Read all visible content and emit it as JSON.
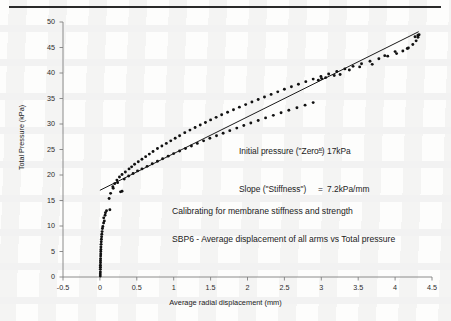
{
  "figure": {
    "axis_titles": {
      "x": "Average radial displacement (mm)",
      "y": "Total Pressure (kPa)"
    },
    "annotations": {
      "initial_pressure_label": "Initial pressure (\"Zero\")",
      "initial_pressure_eq": "=",
      "initial_pressure_value": "17kPa",
      "slope_label": "Slope (\"Stiffness\")",
      "slope_eq": "=",
      "slope_value": "7.2kPa/mm",
      "caption_1": "Calibrating for membrane stiffness and strength",
      "caption_2": "SBP6 - Average displacement of all arms vs Total pressure"
    },
    "colors": {
      "marker": "#111111",
      "fit_line": "#1a1a1a",
      "axis": "#808080",
      "rule": "#2a2a2a",
      "background": "#fdfdfc"
    }
  },
  "chart_data": {
    "type": "scatter",
    "title": "",
    "xlabel": "Average radial displacement (mm)",
    "ylabel": "Total Pressure (kPa)",
    "xlim": [
      -0.5,
      4.5
    ],
    "ylim": [
      0,
      50
    ],
    "xticks": [
      -0.5,
      0,
      0.5,
      1,
      1.5,
      2,
      2.5,
      3,
      3.5,
      4,
      4.5
    ],
    "xtick_labels": [
      "-0.5",
      "0",
      "0.5",
      "1",
      "1.5",
      "2",
      "2.5",
      "3",
      "3.5",
      "4",
      "4.5"
    ],
    "yticks": [
      0,
      5,
      10,
      15,
      20,
      25,
      30,
      35,
      40,
      45,
      50
    ],
    "ytick_labels": [
      "0",
      "5",
      "10",
      "15",
      "20",
      "25",
      "30",
      "35",
      "40",
      "45",
      "50"
    ],
    "grid": false,
    "legend": null,
    "fit_line": {
      "name": "Linear fit",
      "intercept": 17.0,
      "slope": 7.2,
      "x_start": 0.0,
      "x_end": 4.32
    },
    "series": [
      {
        "name": "Initial vertical loading",
        "marker": "filled-circle",
        "points": [
          [
            0.005,
            0.2
          ],
          [
            0.005,
            0.6
          ],
          [
            0.006,
            1.0
          ],
          [
            0.006,
            1.5
          ],
          [
            0.007,
            1.9
          ],
          [
            0.007,
            2.3
          ],
          [
            0.008,
            2.8
          ],
          [
            0.008,
            3.2
          ],
          [
            0.009,
            3.6
          ],
          [
            0.01,
            4.1
          ],
          [
            0.011,
            4.5
          ],
          [
            0.012,
            5.0
          ],
          [
            0.013,
            5.4
          ],
          [
            0.014,
            5.9
          ],
          [
            0.016,
            6.4
          ],
          [
            0.018,
            6.9
          ],
          [
            0.02,
            7.4
          ],
          [
            0.023,
            7.9
          ],
          [
            0.026,
            8.4
          ],
          [
            0.03,
            8.9
          ],
          [
            0.034,
            9.5
          ],
          [
            0.04,
            9.9
          ],
          [
            0.05,
            10.6
          ],
          [
            0.06,
            11.0
          ],
          [
            0.052,
            11.6
          ],
          [
            0.07,
            12.1
          ],
          [
            0.075,
            12.6
          ],
          [
            0.09,
            13.0
          ]
        ]
      },
      {
        "name": "Loading branch (upper)",
        "marker": "filled-circle",
        "points": [
          [
            0.125,
            15.4
          ],
          [
            0.145,
            16.4
          ],
          [
            0.175,
            17.7
          ],
          [
            0.2,
            18.3
          ],
          [
            0.23,
            19.0
          ],
          [
            0.265,
            19.6
          ],
          [
            0.3,
            20.1
          ],
          [
            0.345,
            20.6
          ],
          [
            0.395,
            21.2
          ],
          [
            0.43,
            21.6
          ],
          [
            0.47,
            22.1
          ],
          [
            0.52,
            22.6
          ],
          [
            0.57,
            23.1
          ],
          [
            0.62,
            23.6
          ],
          [
            0.67,
            24.1
          ],
          [
            0.72,
            24.6
          ],
          [
            0.78,
            25.2
          ],
          [
            0.84,
            25.7
          ],
          [
            0.9,
            26.2
          ],
          [
            0.96,
            26.7
          ],
          [
            1.02,
            27.2
          ],
          [
            1.08,
            27.7
          ],
          [
            1.15,
            28.3
          ],
          [
            1.22,
            28.8
          ],
          [
            1.29,
            29.3
          ],
          [
            1.36,
            29.8
          ],
          [
            1.43,
            30.3
          ],
          [
            1.5,
            30.8
          ],
          [
            1.575,
            31.3
          ],
          [
            1.65,
            31.8
          ],
          [
            1.73,
            32.3
          ],
          [
            1.81,
            32.8
          ],
          [
            1.89,
            33.3
          ],
          [
            1.975,
            33.8
          ],
          [
            2.06,
            34.3
          ],
          [
            2.145,
            34.8
          ],
          [
            2.23,
            35.3
          ],
          [
            2.32,
            35.8
          ],
          [
            2.41,
            36.3
          ],
          [
            2.5,
            36.8
          ],
          [
            2.595,
            37.3
          ],
          [
            2.69,
            37.8
          ],
          [
            2.79,
            38.3
          ],
          [
            2.89,
            38.8
          ],
          [
            2.995,
            39.3
          ],
          [
            3.1,
            39.8
          ],
          [
            3.21,
            40.3
          ],
          [
            3.32,
            40.8
          ],
          [
            3.43,
            41.3
          ],
          [
            3.545,
            41.8
          ],
          [
            3.66,
            42.3
          ],
          [
            3.78,
            42.8
          ],
          [
            3.9,
            43.3
          ],
          [
            4.02,
            43.8
          ],
          [
            4.105,
            44.3
          ],
          [
            4.18,
            44.9
          ],
          [
            4.24,
            45.6
          ],
          [
            4.285,
            46.3
          ],
          [
            4.31,
            47.0
          ],
          [
            4.325,
            47.5
          ]
        ]
      },
      {
        "name": "Unloading branch (lower)",
        "marker": "filled-circle",
        "points": [
          [
            0.135,
            13.2
          ],
          [
            0.18,
            17.4
          ],
          [
            0.24,
            18.5
          ],
          [
            0.28,
            16.7
          ],
          [
            0.3,
            16.8
          ],
          [
            0.33,
            19.2
          ],
          [
            0.39,
            19.8
          ],
          [
            0.45,
            20.3
          ],
          [
            0.51,
            20.8
          ],
          [
            0.57,
            21.2
          ],
          [
            0.64,
            21.7
          ],
          [
            0.71,
            22.2
          ],
          [
            0.78,
            22.7
          ],
          [
            0.85,
            23.2
          ],
          [
            0.925,
            23.7
          ],
          [
            1.0,
            24.2
          ],
          [
            1.08,
            24.7
          ],
          [
            1.16,
            25.2
          ],
          [
            1.24,
            25.7
          ],
          [
            1.32,
            26.2
          ],
          [
            1.405,
            26.7
          ],
          [
            1.49,
            27.2
          ],
          [
            1.58,
            27.7
          ],
          [
            1.67,
            28.2
          ],
          [
            1.76,
            28.7
          ],
          [
            1.855,
            29.2
          ],
          [
            1.95,
            29.7
          ],
          [
            2.045,
            30.2
          ],
          [
            2.145,
            30.7
          ],
          [
            2.245,
            31.2
          ],
          [
            2.35,
            31.7
          ],
          [
            2.455,
            32.2
          ],
          [
            2.56,
            32.7
          ],
          [
            2.67,
            33.2
          ],
          [
            2.78,
            33.7
          ],
          [
            2.89,
            34.2
          ],
          [
            2.96,
            38.6
          ],
          [
            3.005,
            38.9
          ],
          [
            3.06,
            39.1
          ],
          [
            3.175,
            39.5
          ],
          [
            3.255,
            39.7
          ],
          [
            3.38,
            40.6
          ],
          [
            3.52,
            41.2
          ],
          [
            3.69,
            41.7
          ],
          [
            3.86,
            43.4
          ],
          [
            4.0,
            44.2
          ],
          [
            4.165,
            44.8
          ],
          [
            4.27,
            47.1
          ],
          [
            4.31,
            47.4
          ]
        ]
      }
    ]
  }
}
